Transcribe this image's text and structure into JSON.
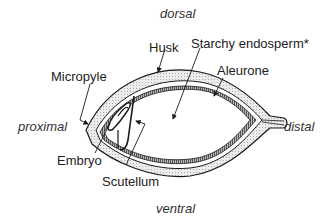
{
  "diagram": {
    "orientation": {
      "top": "dorsal",
      "bottom": "ventral",
      "left": "proximal",
      "right": "distal"
    },
    "labels": {
      "husk": "Husk",
      "starchy_endosperm": "Starchy endosperm*",
      "micropyle": "Micropyle",
      "aleurone": "Aleurone",
      "embryo": "Embryo",
      "scutellum": "Scutellum"
    },
    "colors": {
      "line": "#1a1a1a",
      "husk_fill": "#e6e6e6",
      "background": "#ffffff"
    }
  }
}
